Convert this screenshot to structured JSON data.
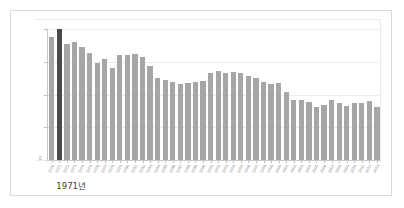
{
  "chart_data": {
    "type": "bar",
    "title": "",
    "subtitle": "",
    "xlabel": "",
    "ylabel": "",
    "grid": true,
    "legend": "none",
    "ylim": [
      0,
      1073918
    ],
    "y_ticks": [
      {
        "value": 1073918,
        "label": "1,073,918"
      },
      {
        "value": 805439,
        "label": "805,439"
      },
      {
        "value": 536959,
        "label": "536,959"
      },
      {
        "value": 268480,
        "label": "268,480"
      },
      {
        "value": 0,
        "label": "0"
      }
    ],
    "highlight_index": 1,
    "highlight_label": "1971년",
    "categories": [
      "1970",
      "1971",
      "1972",
      "1973",
      "1974",
      "1975",
      "1976",
      "1977",
      "1978",
      "1979",
      "1980",
      "1981",
      "1982",
      "1983",
      "1984",
      "1985",
      "1986",
      "1987",
      "1988",
      "1989",
      "1990",
      "1991",
      "1992",
      "1993",
      "1994",
      "1995",
      "1996",
      "1997",
      "1998",
      "1999",
      "2000",
      "2001",
      "2002",
      "2003",
      "2004",
      "2005",
      "2006",
      "2007",
      "2008",
      "2009",
      "2010",
      "2011",
      "2012",
      "2013"
    ],
    "values": [
      1006645,
      1073918,
      952780,
      965521,
      922823,
      874030,
      796331,
      825339,
      750728,
      862669,
      862835,
      867409,
      848312,
      769155,
      674793,
      655489,
      636019,
      623831,
      633092,
      639431,
      649738,
      709275,
      730678,
      715826,
      721185,
      715020,
      691226,
      675394,
      641594,
      620668,
      634501,
      554895,
      492111,
      490543,
      472761,
      435031,
      448153,
      493189,
      465892,
      444849,
      470171,
      471265,
      484550,
      436455
    ],
    "bar_color": "#a6a6a6",
    "highlight_color": "#4a4a4a",
    "gridline_color": "#ededed",
    "axis_color": "#c8c8c8",
    "tick_text_color": "#8c8c8c",
    "annotation_text_color": "#3d3d3d",
    "background_color": "#ffffff",
    "frame_color": "#d9d9d9"
  }
}
